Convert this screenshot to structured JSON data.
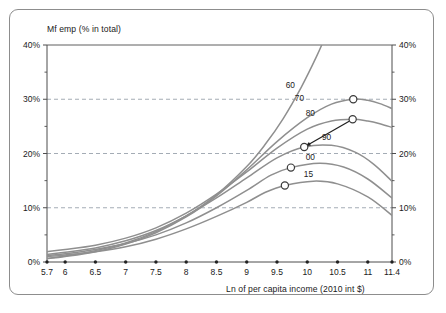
{
  "chart_data": {
    "type": "line",
    "title": "",
    "ylabel": "Mf emp (% in total)",
    "xlabel": "Ln of per capita income (2010 int $)",
    "xlim": [
      5.7,
      11.4
    ],
    "ylim": [
      0,
      40
    ],
    "grid": true,
    "gridlines_y": [
      10,
      20,
      30
    ],
    "legend_position": "inline-curve-labels",
    "x_ticks": [
      "5.7",
      "6",
      "6.5",
      "7",
      "7.5",
      "8",
      "8.5",
      "9",
      "9.5",
      "10",
      "10.5",
      "11",
      "11.4"
    ],
    "x_tick_values": [
      5.7,
      6,
      6.5,
      7,
      7.5,
      8,
      8.5,
      9,
      9.5,
      10,
      10.5,
      11,
      11.4
    ],
    "y_ticks_left": [
      "0%",
      "10%",
      "20%",
      "30%",
      "40%"
    ],
    "y_ticks_right": [
      "0%",
      "10%",
      "20%",
      "30%",
      "40%"
    ],
    "y_tick_values": [
      0,
      10,
      20,
      30,
      40
    ],
    "y_minor_ticks": [
      5,
      15,
      25,
      35
    ],
    "annotations": [
      {
        "name": "shift-arrow",
        "from_x": 10.75,
        "from_y": 26.3,
        "to_x": 9.95,
        "to_y": 21.2
      }
    ],
    "series": [
      {
        "name": "60",
        "label": "60",
        "color": "#8f8f8f",
        "label_x": 9.72,
        "label_y": 32.0,
        "peak_marker": null,
        "points": [
          {
            "x": 5.7,
            "y": 0.7
          },
          {
            "x": 6.0,
            "y": 1.1
          },
          {
            "x": 6.5,
            "y": 2.1
          },
          {
            "x": 7.0,
            "y": 3.5
          },
          {
            "x": 7.5,
            "y": 5.6
          },
          {
            "x": 8.0,
            "y": 8.5
          },
          {
            "x": 8.5,
            "y": 12.4
          },
          {
            "x": 9.0,
            "y": 17.6
          },
          {
            "x": 9.3,
            "y": 21.6
          },
          {
            "x": 9.6,
            "y": 26.4
          },
          {
            "x": 9.9,
            "y": 32.2
          },
          {
            "x": 10.15,
            "y": 37.8
          },
          {
            "x": 10.3,
            "y": 41.6
          }
        ]
      },
      {
        "name": "70",
        "label": "70",
        "color": "#8f8f8f",
        "label_x": 9.87,
        "label_y": 29.6,
        "peak_marker": {
          "x": 10.76,
          "y": 30.0
        },
        "points": [
          {
            "x": 5.7,
            "y": 0.6
          },
          {
            "x": 6.0,
            "y": 1.0
          },
          {
            "x": 6.5,
            "y": 1.9
          },
          {
            "x": 7.0,
            "y": 3.3
          },
          {
            "x": 7.5,
            "y": 5.4
          },
          {
            "x": 8.0,
            "y": 8.3
          },
          {
            "x": 8.5,
            "y": 12.2
          },
          {
            "x": 9.0,
            "y": 17.0
          },
          {
            "x": 9.5,
            "y": 22.2
          },
          {
            "x": 10.0,
            "y": 26.6
          },
          {
            "x": 10.4,
            "y": 29.1
          },
          {
            "x": 10.76,
            "y": 30.0
          },
          {
            "x": 11.0,
            "y": 29.8
          },
          {
            "x": 11.2,
            "y": 29.2
          },
          {
            "x": 11.4,
            "y": 28.3
          }
        ]
      },
      {
        "name": "80",
        "label": "80",
        "color": "#8f8f8f",
        "label_x": 10.05,
        "label_y": 26.9,
        "peak_marker": {
          "x": 10.75,
          "y": 26.3
        },
        "points": [
          {
            "x": 5.7,
            "y": 1.9
          },
          {
            "x": 6.0,
            "y": 2.3
          },
          {
            "x": 6.5,
            "y": 3.1
          },
          {
            "x": 7.0,
            "y": 4.4
          },
          {
            "x": 7.5,
            "y": 6.3
          },
          {
            "x": 8.0,
            "y": 9.0
          },
          {
            "x": 8.5,
            "y": 12.5
          },
          {
            "x": 9.0,
            "y": 16.6
          },
          {
            "x": 9.5,
            "y": 21.0
          },
          {
            "x": 10.0,
            "y": 24.5
          },
          {
            "x": 10.4,
            "y": 26.0
          },
          {
            "x": 10.75,
            "y": 26.3
          },
          {
            "x": 11.0,
            "y": 26.0
          },
          {
            "x": 11.2,
            "y": 25.5
          },
          {
            "x": 11.4,
            "y": 24.8
          }
        ]
      },
      {
        "name": "90",
        "label": "90",
        "color": "#8f8f8f",
        "label_x": 10.32,
        "label_y": 22.4,
        "peak_marker": {
          "x": 9.95,
          "y": 21.2
        },
        "points": [
          {
            "x": 5.7,
            "y": 1.4
          },
          {
            "x": 6.0,
            "y": 1.8
          },
          {
            "x": 6.5,
            "y": 2.6
          },
          {
            "x": 7.0,
            "y": 3.9
          },
          {
            "x": 7.5,
            "y": 5.8
          },
          {
            "x": 8.0,
            "y": 8.5
          },
          {
            "x": 8.5,
            "y": 11.8
          },
          {
            "x": 9.0,
            "y": 15.5
          },
          {
            "x": 9.5,
            "y": 19.2
          },
          {
            "x": 9.95,
            "y": 21.2
          },
          {
            "x": 10.4,
            "y": 21.5
          },
          {
            "x": 10.8,
            "y": 20.2
          },
          {
            "x": 11.1,
            "y": 18.0
          },
          {
            "x": 11.4,
            "y": 14.9
          }
        ]
      },
      {
        "name": "00",
        "label": "00",
        "color": "#8f8f8f",
        "label_x": 10.05,
        "label_y": 18.8,
        "peak_marker": {
          "x": 9.73,
          "y": 17.4
        },
        "points": [
          {
            "x": 5.7,
            "y": 1.2
          },
          {
            "x": 6.0,
            "y": 1.5
          },
          {
            "x": 6.5,
            "y": 2.3
          },
          {
            "x": 7.0,
            "y": 3.4
          },
          {
            "x": 7.5,
            "y": 5.0
          },
          {
            "x": 8.0,
            "y": 7.2
          },
          {
            "x": 8.5,
            "y": 10.0
          },
          {
            "x": 9.0,
            "y": 13.2
          },
          {
            "x": 9.4,
            "y": 16.0
          },
          {
            "x": 9.73,
            "y": 17.4
          },
          {
            "x": 10.2,
            "y": 18.2
          },
          {
            "x": 10.6,
            "y": 17.5
          },
          {
            "x": 11.0,
            "y": 15.3
          },
          {
            "x": 11.4,
            "y": 11.8
          }
        ]
      },
      {
        "name": "15",
        "label": "15",
        "color": "#8f8f8f",
        "label_x": 10.02,
        "label_y": 15.6,
        "peak_marker": {
          "x": 9.63,
          "y": 14.1
        },
        "points": [
          {
            "x": 5.7,
            "y": 1.0
          },
          {
            "x": 6.0,
            "y": 1.3
          },
          {
            "x": 6.5,
            "y": 1.9
          },
          {
            "x": 7.0,
            "y": 2.8
          },
          {
            "x": 7.5,
            "y": 4.2
          },
          {
            "x": 8.0,
            "y": 6.1
          },
          {
            "x": 8.5,
            "y": 8.4
          },
          {
            "x": 9.0,
            "y": 11.0
          },
          {
            "x": 9.3,
            "y": 12.8
          },
          {
            "x": 9.63,
            "y": 14.1
          },
          {
            "x": 10.1,
            "y": 14.9
          },
          {
            "x": 10.5,
            "y": 14.4
          },
          {
            "x": 11.0,
            "y": 12.0
          },
          {
            "x": 11.4,
            "y": 8.6
          }
        ]
      }
    ],
    "colors": {
      "curve": "#8f8f8f",
      "axis": "#4d4d4d",
      "grid": "#9aa3ad",
      "marker_fill": "#ffffff",
      "marker_stroke": "#3a3a3a",
      "frame": "#8d8d8d",
      "text": "#1a1a1a"
    }
  }
}
